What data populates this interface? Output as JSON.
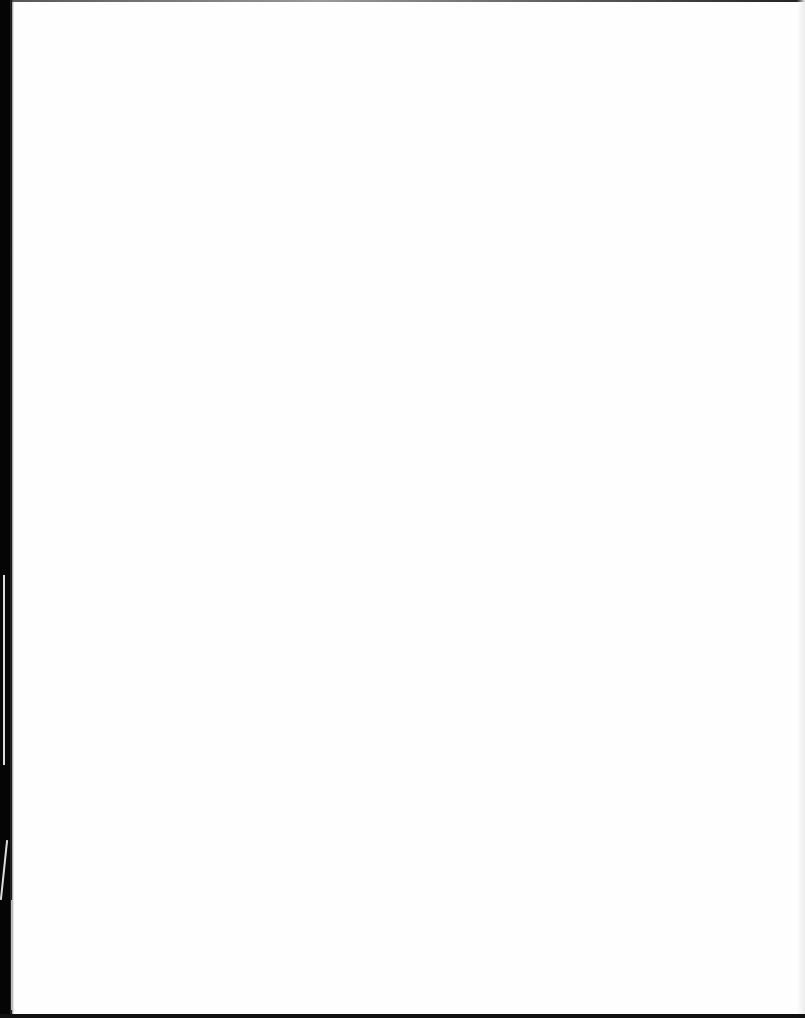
{
  "page": {
    "type": "blank-scanned-page",
    "text": "",
    "colors": {
      "paper": "#fefefe",
      "edge": "#050505"
    }
  }
}
